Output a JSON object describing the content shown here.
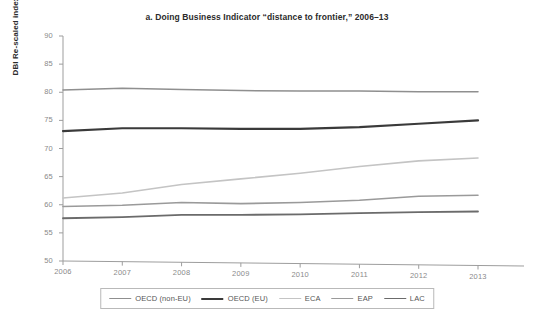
{
  "chart_data": {
    "type": "line",
    "title": "a. Doing Business Indicator “distance to frontier,” 2006–13",
    "xlabel": "",
    "ylabel": "DBI Re-scaled index",
    "x": [
      2006,
      2007,
      2008,
      2009,
      2010,
      2011,
      2012,
      2013
    ],
    "categories": [
      "2006",
      "2007",
      "2008",
      "2009",
      "2010",
      "2011",
      "2012",
      "2013"
    ],
    "xlim": [
      2006,
      2013
    ],
    "ylim": [
      50,
      90
    ],
    "yticks": [
      50,
      55,
      60,
      65,
      70,
      75,
      80,
      85,
      90
    ],
    "ytick_labels": [
      "50",
      "55",
      "60",
      "65",
      "70",
      "75",
      "80",
      "85",
      "90"
    ],
    "grid": false,
    "legend_position": "bottom",
    "series": [
      {
        "name": "OECD (non-EU)",
        "color": "#8f8f8f",
        "width": 1.5,
        "values": [
          80.4,
          80.7,
          80.5,
          80.3,
          80.2,
          80.2,
          80.1,
          80.1
        ]
      },
      {
        "name": "OECD (EU)",
        "color": "#3a3a3a",
        "width": 2.2,
        "values": [
          73.1,
          73.6,
          73.6,
          73.5,
          73.5,
          73.8,
          74.4,
          75.0
        ]
      },
      {
        "name": "ECA",
        "color": "#c4c4c4",
        "width": 1.6,
        "values": [
          61.2,
          62.1,
          63.6,
          64.6,
          65.6,
          66.8,
          67.8,
          68.3
        ]
      },
      {
        "name": "EAP",
        "color": "#9a9a9a",
        "width": 1.6,
        "values": [
          59.7,
          59.9,
          60.4,
          60.2,
          60.4,
          60.8,
          61.5,
          61.7
        ]
      },
      {
        "name": "LAC",
        "color": "#6b6b6b",
        "width": 1.8,
        "values": [
          57.6,
          57.8,
          58.2,
          58.2,
          58.3,
          58.5,
          58.7,
          58.8
        ]
      }
    ]
  },
  "axis": {
    "line_color": "#9d9d9d",
    "tick_color": "#9d9d9d",
    "label_color": "#8a8a8a"
  }
}
